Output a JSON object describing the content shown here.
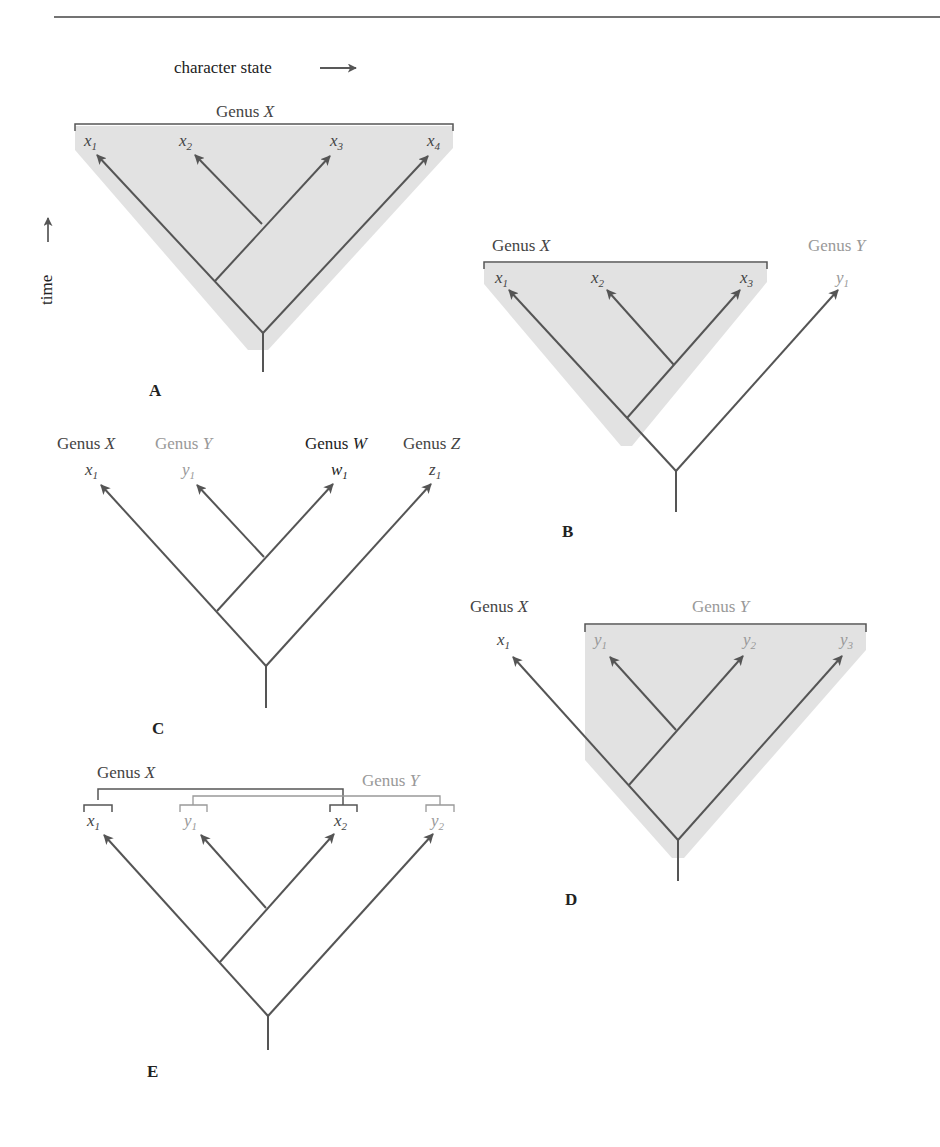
{
  "colors": {
    "line": "#555555",
    "shade": "#e2e2e2",
    "text_dark": "#444444",
    "text_light": "#999999",
    "text_black": "#222222"
  },
  "axes": {
    "x_label": "character state",
    "y_label": "time"
  },
  "panels": {
    "A": {
      "label": "A",
      "genus_x": "Genus X",
      "tips": [
        {
          "base": "x",
          "sub": "1"
        },
        {
          "base": "x",
          "sub": "2"
        },
        {
          "base": "x",
          "sub": "3"
        },
        {
          "base": "x",
          "sub": "4"
        }
      ]
    },
    "B": {
      "label": "B",
      "genus_x": "Genus X",
      "genus_y": "Genus Y",
      "tips": [
        {
          "base": "x",
          "sub": "1"
        },
        {
          "base": "x",
          "sub": "2"
        },
        {
          "base": "x",
          "sub": "3"
        },
        {
          "base": "y",
          "sub": "1"
        }
      ]
    },
    "C": {
      "label": "C",
      "genera": [
        "Genus X",
        "Genus Y",
        "Genus W",
        "Genus Z"
      ],
      "tips": [
        {
          "base": "x",
          "sub": "1"
        },
        {
          "base": "y",
          "sub": "1"
        },
        {
          "base": "w",
          "sub": "1"
        },
        {
          "base": "z",
          "sub": "1"
        }
      ]
    },
    "D": {
      "label": "D",
      "genus_x": "Genus X",
      "genus_y": "Genus Y",
      "tips": [
        {
          "base": "x",
          "sub": "1"
        },
        {
          "base": "y",
          "sub": "1"
        },
        {
          "base": "y",
          "sub": "2"
        },
        {
          "base": "y",
          "sub": "3"
        }
      ]
    },
    "E": {
      "label": "E",
      "genus_x": "Genus X",
      "genus_y": "Genus Y",
      "tips": [
        {
          "base": "x",
          "sub": "1"
        },
        {
          "base": "y",
          "sub": "1"
        },
        {
          "base": "x",
          "sub": "2"
        },
        {
          "base": "y",
          "sub": "2"
        }
      ]
    }
  }
}
